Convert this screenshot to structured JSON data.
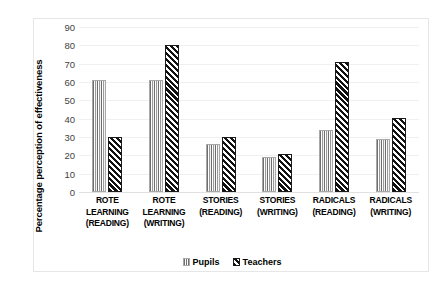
{
  "chart_data": {
    "type": "bar",
    "title": "",
    "xlabel": "",
    "ylabel": "Percentage perception of effectiveness",
    "ylim": [
      0,
      90
    ],
    "ytick_step": 10,
    "yticks": [
      0,
      10,
      20,
      30,
      40,
      50,
      60,
      70,
      80,
      90
    ],
    "grid": true,
    "legend_position": "bottom-center",
    "categories": [
      "ROTE LEARNING (READING)",
      "ROTE LEARNING (WRITING)",
      "STORIES (READING)",
      "STORIES (WRITING)",
      "RADICALS (READING)",
      "RADICALS (WRITING)"
    ],
    "category_lines": [
      [
        "ROTE",
        "LEARNING",
        "(READING)"
      ],
      [
        "ROTE",
        "LEARNING",
        "(WRITING)"
      ],
      [
        "STORIES",
        "(READING)"
      ],
      [
        "STORIES",
        "(WRITING)"
      ],
      [
        "RADICALS",
        "(READING)"
      ],
      [
        "RADICALS",
        "(WRITING)"
      ]
    ],
    "series": [
      {
        "name": "Pupils",
        "pattern": "vertical-stripes",
        "color": "#9a9a9a",
        "values": [
          61,
          61,
          26,
          19,
          34,
          29
        ]
      },
      {
        "name": "Teachers",
        "pattern": "diagonal-hatch",
        "color": "#111111",
        "values": [
          30,
          80,
          30,
          20.5,
          71,
          40.5
        ]
      }
    ]
  },
  "legend": {
    "items": [
      {
        "label": "Pupils"
      },
      {
        "label": "Teachers"
      }
    ]
  }
}
